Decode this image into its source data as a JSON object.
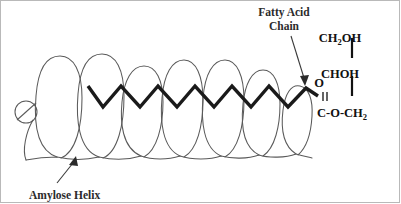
{
  "figure": {
    "background_color": "#ffffff",
    "border_color": "#b9b9b9"
  },
  "labels": {
    "fatty_acid_line1": "Fatty Acid",
    "fatty_acid_line2": "Chain",
    "amylose": "Amylose Helix"
  },
  "structure": {
    "ch2oh": "CH",
    "ch2oh_sub": "2",
    "ch2oh_tail": "OH",
    "choh": "CHOH",
    "ester_c": "C-O-CH",
    "ester_sub": "2",
    "carbonyl_o": "O",
    "double_bond": "||"
  },
  "colors": {
    "helix_stroke": "#5a5a5a",
    "chain_stroke": "#1a1a1a",
    "text": "#2b2b2b",
    "formula_text": "#111111",
    "arrow": "#3a3a3a"
  },
  "chain_geometry": {
    "stroke_width": 3.4,
    "peak_y": 86,
    "valley_y": 107,
    "start_x": 88,
    "end_x": 318
  },
  "helix_geometry": {
    "loop_count": 7,
    "loop_spacing": 42,
    "first_loop_cx": 58,
    "baseline_y": 158
  }
}
